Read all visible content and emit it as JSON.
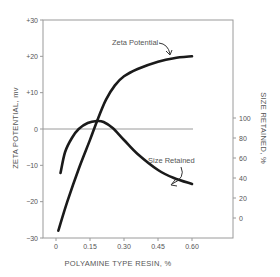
{
  "chart_data": {
    "type": "line",
    "title": "",
    "xlabel": "POLYAMINE TYPE RESIN, %",
    "ylabel": "ZETA POTENTIAL, mv",
    "y2label": "SIZE RETAINED, %",
    "xlim": [
      0,
      0.6
    ],
    "ylim": [
      -30,
      30
    ],
    "y2lim": [
      0,
      100
    ],
    "x_ticks": [
      0,
      0.15,
      0.3,
      0.45,
      0.6
    ],
    "x_tick_labels": [
      "0",
      "0.15",
      "0.30",
      "0.45",
      "0.60"
    ],
    "y_ticks": [
      30,
      20,
      10,
      0,
      -10,
      -20,
      -30
    ],
    "y_tick_labels": [
      "+30",
      "+20",
      "+10",
      "0",
      "−10",
      "−20",
      "−30"
    ],
    "y2_ticks": [
      100,
      80,
      60,
      40,
      20,
      0
    ],
    "y2_tick_labels": [
      "100",
      "80",
      "60",
      "40",
      "20",
      "0"
    ],
    "grid": false,
    "reference_line": {
      "axis": "y",
      "value": 0
    },
    "series": [
      {
        "name": "Zeta Potential",
        "axis": "left",
        "x": [
          0.01,
          0.05,
          0.1,
          0.15,
          0.18,
          0.22,
          0.26,
          0.3,
          0.36,
          0.45,
          0.52,
          0.6
        ],
        "values": [
          -28,
          -20,
          -11,
          -3,
          2,
          8,
          12,
          14.5,
          16.5,
          18.5,
          19.5,
          20
        ]
      },
      {
        "name": "Size Retained",
        "axis": "right",
        "x": [
          0.02,
          0.04,
          0.07,
          0.1,
          0.14,
          0.18,
          0.21,
          0.25,
          0.3,
          0.36,
          0.45,
          0.52,
          0.6
        ],
        "values": [
          45,
          66,
          80,
          89,
          95,
          97,
          96,
          90,
          78,
          64,
          48,
          40,
          34
        ]
      }
    ],
    "annotations": [
      {
        "text": "Zeta Potential",
        "target_series": "Zeta Potential"
      },
      {
        "text": "Size Retained",
        "target_series": "Size Retained"
      }
    ]
  }
}
